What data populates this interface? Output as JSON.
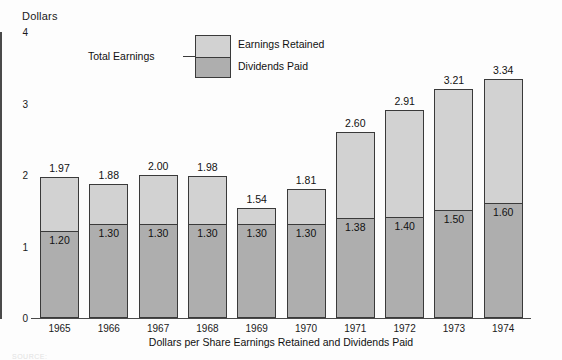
{
  "chart_data": {
    "type": "bar",
    "title": "",
    "subtitle": "",
    "caption": "Dollars per Share Earnings Retained and Dividends Paid",
    "axis_title": "Dollars",
    "xlabel": "",
    "ylabel": "Dollars",
    "ylim": [
      0,
      4
    ],
    "yticks": [
      0,
      1,
      2,
      3,
      4
    ],
    "ytick_labels": [
      "0",
      "1",
      "2",
      "3",
      "4"
    ],
    "grid": false,
    "stacked": true,
    "legend_position": "top-center",
    "categories": [
      "1965",
      "1966",
      "1967",
      "1968",
      "1969",
      "1970",
      "1971",
      "1972",
      "1973",
      "1974"
    ],
    "series": [
      {
        "name": "Dividends Paid",
        "color": "#aeaeae",
        "values": [
          1.2,
          1.3,
          1.3,
          1.3,
          1.3,
          1.3,
          1.38,
          1.4,
          1.5,
          1.6
        ],
        "labels": [
          "1.20",
          "1.30",
          "1.30",
          "1.30",
          "1.30",
          "1.30",
          "1.38",
          "1.40",
          "1.50",
          "1.60"
        ]
      },
      {
        "name": "Earnings Retained",
        "color": "#d2d2d2",
        "values": [
          0.77,
          0.58,
          0.7,
          0.68,
          0.24,
          0.51,
          1.22,
          1.51,
          1.71,
          1.74
        ],
        "labels": [
          "",
          "",
          "",
          "",
          "",
          "",
          "",
          "",
          "",
          ""
        ]
      }
    ],
    "totals": {
      "name": "Total Earnings",
      "values": [
        1.97,
        1.88,
        2.0,
        1.98,
        1.54,
        1.81,
        2.6,
        2.91,
        3.21,
        3.34
      ],
      "labels": [
        "1.97",
        "1.88",
        "2.00",
        "1.98",
        "1.54",
        "1.81",
        "2.60",
        "2.91",
        "3.21",
        "3.34"
      ]
    }
  },
  "legend": {
    "total_label": "Total Earnings",
    "retained_label": "Earnings Retained",
    "dividends_label": "Dividends Paid",
    "retained_color": "#d2d2d2",
    "dividends_color": "#aeaeae"
  },
  "source_note": "SOURCE:"
}
